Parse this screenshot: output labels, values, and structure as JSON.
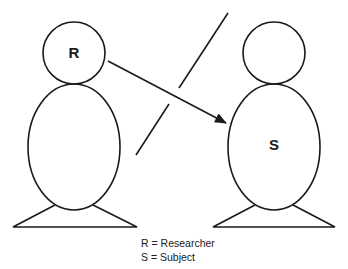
{
  "figures": {
    "researcher": {
      "letter": "R"
    },
    "subject": {
      "letter": "S"
    }
  },
  "legend": {
    "items": [
      {
        "text": "R = Researcher"
      },
      {
        "text": "S = Subject"
      }
    ]
  },
  "colors": {
    "stroke": "#1a1a1a",
    "background": "#ffffff"
  }
}
